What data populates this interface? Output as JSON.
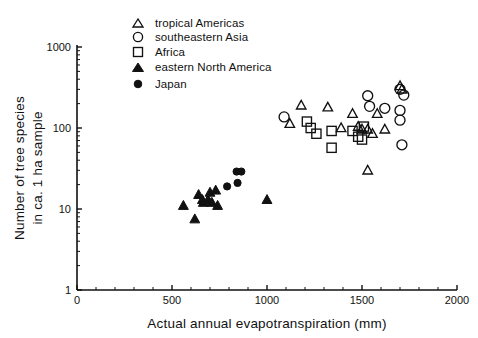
{
  "chart_data": {
    "type": "scatter",
    "title": "",
    "xlabel": "Actual annual evapotranspiration (mm)",
    "ylabel": "Number of tree species in ca. 1 ha sample",
    "ylabel_line1": "Number of tree species",
    "ylabel_line2": "in ca. 1 ha sample",
    "xlim": [
      0,
      2000
    ],
    "ylim": [
      1,
      1000
    ],
    "yscale": "log",
    "xscale": "linear",
    "xticks": [
      0,
      500,
      1000,
      1500,
      2000
    ],
    "xticklabels": [
      "0",
      "500",
      "1000",
      "1500",
      "2000"
    ],
    "yticks": [
      1,
      10,
      100,
      1000
    ],
    "yticklabels": [
      "1",
      "10",
      "100",
      "1000"
    ],
    "grid": false,
    "legend_position": "top-center",
    "legend": [
      {
        "label": "tropical Americas",
        "marker": "open-triangle"
      },
      {
        "label": "southeastern Asia",
        "marker": "open-circle"
      },
      {
        "label": "Africa",
        "marker": "open-square"
      },
      {
        "label": "eastern North America",
        "marker": "filled-triangle"
      },
      {
        "label": "Japan",
        "marker": "filled-circle"
      }
    ],
    "series": [
      {
        "name": "tropical Americas",
        "marker": "open-triangle",
        "points": [
          [
            1120,
            113
          ],
          [
            1180,
            190
          ],
          [
            1320,
            180
          ],
          [
            1450,
            150
          ],
          [
            1480,
            104
          ],
          [
            1500,
            96
          ],
          [
            1530,
            96
          ],
          [
            1555,
            85
          ],
          [
            1580,
            150
          ],
          [
            1620,
            96
          ],
          [
            1700,
            330
          ],
          [
            1710,
            300
          ],
          [
            1530,
            30
          ],
          [
            1390,
            100
          ]
        ]
      },
      {
        "name": "southeastern Asia",
        "marker": "open-circle",
        "points": [
          [
            1090,
            137
          ],
          [
            1530,
            250
          ],
          [
            1540,
            185
          ],
          [
            1620,
            175
          ],
          [
            1700,
            300
          ],
          [
            1720,
            255
          ],
          [
            1700,
            165
          ],
          [
            1700,
            125
          ],
          [
            1710,
            62
          ]
        ]
      },
      {
        "name": "Africa",
        "marker": "open-square",
        "points": [
          [
            1210,
            120
          ],
          [
            1230,
            100
          ],
          [
            1260,
            85
          ],
          [
            1340,
            92
          ],
          [
            1340,
            57
          ],
          [
            1450,
            92
          ],
          [
            1480,
            78
          ],
          [
            1500,
            72
          ],
          [
            1510,
            104
          ]
        ]
      },
      {
        "name": "eastern North America",
        "marker": "filled-triangle",
        "points": [
          [
            560,
            11
          ],
          [
            620,
            7.5
          ],
          [
            640,
            15
          ],
          [
            660,
            13
          ],
          [
            665,
            12
          ],
          [
            690,
            13
          ],
          [
            700,
            16
          ],
          [
            710,
            12
          ],
          [
            730,
            17
          ],
          [
            740,
            11
          ],
          [
            1000,
            13
          ]
        ]
      },
      {
        "name": "Japan",
        "marker": "filled-circle",
        "points": [
          [
            790,
            19
          ],
          [
            840,
            29
          ],
          [
            865,
            29
          ],
          [
            845,
            21
          ]
        ]
      }
    ]
  },
  "axes": {
    "x_title": "Actual annual evapotranspiration (mm)",
    "y_title_line1": "Number of tree species",
    "y_title_line2": "in ca. 1 ha sample"
  },
  "colors": {
    "ink": "#111111",
    "background": "#ffffff"
  }
}
